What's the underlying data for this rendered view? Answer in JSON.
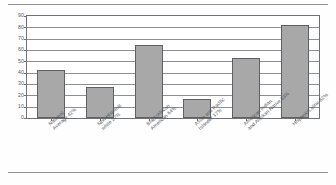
{
  "chart_data": {
    "type": "bar",
    "title": "",
    "subtitle": "",
    "xlabel": "",
    "ylabel": "",
    "ylim": [
      0,
      90
    ],
    "ytick_step": 10,
    "yticks": [
      "90",
      "80",
      "70",
      "60",
      "50",
      "40",
      "30",
      "20",
      "10",
      "0"
    ],
    "grid": true,
    "legend": false,
    "legend_position": "none",
    "bar_color": "#a8a8a8",
    "bar_border_color": "#5e6063",
    "categories": [
      "National Average 42%",
      "Non-Hispanic white 27%",
      "Black/African American 64%",
      "Asian and Pacific Islander 17%",
      "American Indian and Alaskan Native 53%",
      "Hispanic/Latino 82%"
    ],
    "category_lines": [
      [
        "National",
        "Average 42%"
      ],
      [
        "Non-Hispanic",
        "white 27%"
      ],
      [
        "Black/African",
        "American 64%"
      ],
      [
        "Asian and Pacific",
        "Islander 17%"
      ],
      [
        "American Indian",
        "and Alaskan Native 53%"
      ],
      [
        "Hispanic/Latino 82%",
        ""
      ]
    ],
    "values": [
      42,
      27,
      64,
      17,
      53,
      82
    ]
  }
}
